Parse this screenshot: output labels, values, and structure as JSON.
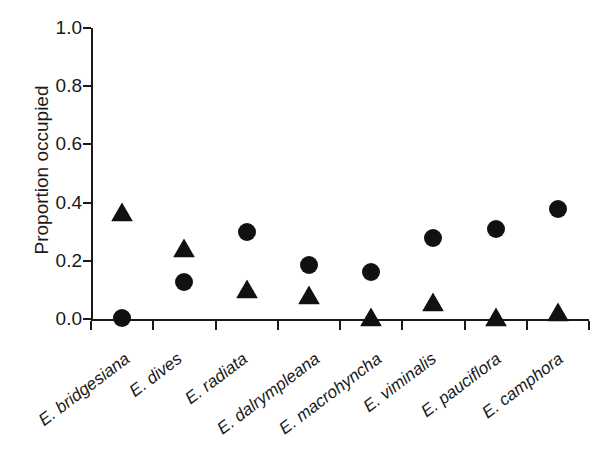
{
  "chart_data": {
    "type": "scatter",
    "title": "",
    "xlabel": "",
    "ylabel": "Proportion occupied",
    "ylim": [
      0.0,
      1.0
    ],
    "yticks": [
      "0.0",
      "0.2",
      "0.4",
      "0.6",
      "0.8",
      "1.0"
    ],
    "ytick_values": [
      0.0,
      0.2,
      0.4,
      0.6,
      0.8,
      1.0
    ],
    "grid": false,
    "legend_position": "none",
    "categories": [
      "E. bridgesiana",
      "E. dives",
      "E. radiata",
      "E. dalrympleana",
      "E. macrohyncha",
      "E. viminalis",
      "E. pauciflora",
      "E. camphora"
    ],
    "series": [
      {
        "name": "circle-series",
        "marker": "circle",
        "color": "#111111",
        "values": [
          0.005,
          0.127,
          0.3,
          0.185,
          0.16,
          0.277,
          0.31,
          0.378
        ]
      },
      {
        "name": "triangle-series",
        "marker": "triangle",
        "color": "#111111",
        "values": [
          0.367,
          0.243,
          0.103,
          0.082,
          0.008,
          0.058,
          0.008,
          0.025
        ]
      }
    ]
  },
  "axes": {
    "y_axis_name": "y-axis",
    "x_axis_name": "x-axis"
  }
}
